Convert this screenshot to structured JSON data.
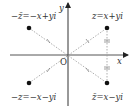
{
  "diagram": {
    "axes": {
      "x_label": "x",
      "y_label": "y",
      "origin_label": "O"
    },
    "points": [
      {
        "id": "z",
        "label": "z=x+yi",
        "quadrant": "I"
      },
      {
        "id": "neg_conj",
        "label": "−z̄=−x+yi",
        "quadrant": "II"
      },
      {
        "id": "neg_z",
        "label": "−z=−x−yi",
        "quadrant": "III"
      },
      {
        "id": "conj",
        "label": "z̄=x−yi",
        "quadrant": "IV"
      }
    ],
    "colors": {
      "axis": "#222222",
      "dashed": "#888888",
      "point": "#111111",
      "text": "#333333"
    }
  }
}
